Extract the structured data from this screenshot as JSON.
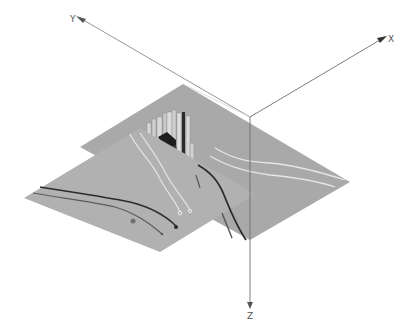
{
  "diagram": {
    "type": "3d-isometric-slice-view",
    "axes": {
      "x": {
        "label": "X"
      },
      "y": {
        "label": "Y"
      },
      "z": {
        "label": "Z"
      }
    },
    "colors": {
      "background": "#ffffff",
      "plane_fill": "#a9a9a9",
      "plane_fill_front": "#b1b1b1",
      "axis_line": "#6e6e6e",
      "well_dark": "#2b2b2b",
      "well_light": "#e4e4e4",
      "block_dark": "#1e1e1e",
      "block_light": "#d6d6d6"
    },
    "planes": [
      {
        "name": "back-slice"
      },
      {
        "name": "front-slice"
      }
    ]
  }
}
